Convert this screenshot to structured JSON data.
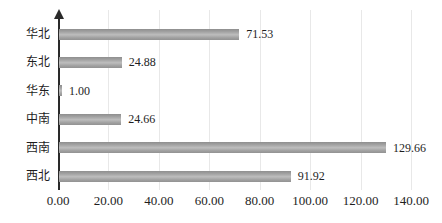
{
  "chart_data": {
    "type": "bar",
    "orientation": "horizontal",
    "title": "",
    "xlabel": "",
    "ylabel": "",
    "categories": [
      "华北",
      "东北",
      "华东",
      "中南",
      "西南",
      "西北"
    ],
    "values": [
      71.53,
      24.88,
      1.0,
      24.66,
      129.66,
      91.92
    ],
    "value_labels": [
      "71.53",
      "24.88",
      "1.00",
      "24.66",
      "129.66",
      "91.92"
    ],
    "xlim": [
      0,
      140
    ],
    "x_tick_step": 20,
    "x_tick_labels": [
      "0.00",
      "20.00",
      "40.00",
      "60.00",
      "80.00",
      "100.00",
      "120.00",
      "140.00"
    ],
    "grid": "vertical-light",
    "legend": "none",
    "colors": {
      "bar_base": "#a2a2a2",
      "bar_gradient_edge": "#8e8e8e",
      "bar_gradient_mid": "#bdbdbd",
      "axis": "#2a2a2a",
      "gridline": "#e8e8e8",
      "text": "#1e1e1e",
      "background": "#ffffff"
    }
  }
}
